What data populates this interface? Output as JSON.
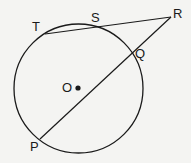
{
  "diagram": {
    "type": "geometry-circle-secants",
    "circle": {
      "center_label": "O",
      "cx": 78.5,
      "cy": 88.5,
      "r": 64.5
    },
    "points": {
      "T": {
        "label": "T",
        "x": 45,
        "y": 34
      },
      "S": {
        "label": "S",
        "x": 96,
        "y": 26
      },
      "R": {
        "label": "R",
        "x": 171,
        "y": 17
      },
      "Q": {
        "label": "Q",
        "x": 132,
        "y": 54
      },
      "P": {
        "label": "P",
        "x": 40,
        "y": 139
      },
      "O": {
        "label": "O",
        "x": 78,
        "y": 88
      }
    },
    "segments": [
      {
        "name": "T-R",
        "from": "T",
        "to": "R"
      },
      {
        "name": "P-R",
        "from": "P",
        "to": "R"
      }
    ],
    "colors": {
      "stroke": "#1a1a1a",
      "background": "#f4f4f2"
    }
  }
}
